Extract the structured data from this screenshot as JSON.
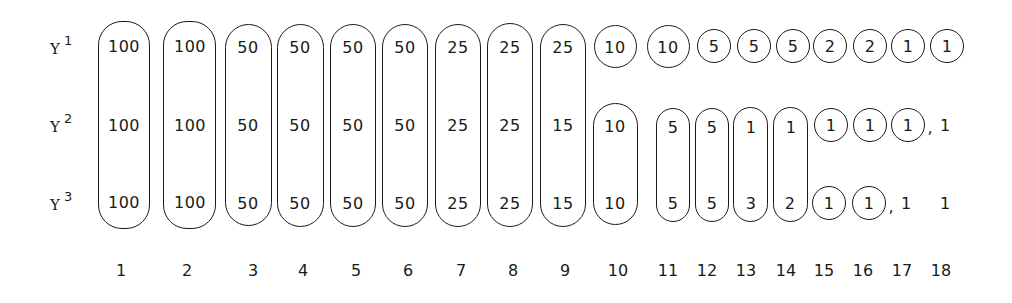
{
  "diagram": {
    "row_labels": [
      {
        "base": "Y",
        "sup": "1"
      },
      {
        "base": "Y",
        "sup": "2"
      },
      {
        "base": "Y",
        "sup": "3"
      }
    ],
    "columns": [
      {
        "index": "1",
        "y1": "100",
        "y2": "100",
        "y3": "100",
        "grouping": "Y1-Y2-Y3 enclosed together"
      },
      {
        "index": "2",
        "y1": "100",
        "y2": "100",
        "y3": "100",
        "grouping": "Y1-Y2-Y3 enclosed together"
      },
      {
        "index": "3",
        "y1": "50",
        "y2": "50",
        "y3": "50",
        "grouping": "Y1-Y2-Y3 enclosed together"
      },
      {
        "index": "4",
        "y1": "50",
        "y2": "50",
        "y3": "50",
        "grouping": "Y1-Y2-Y3 enclosed together"
      },
      {
        "index": "5",
        "y1": "50",
        "y2": "50",
        "y3": "50",
        "grouping": "Y1-Y2-Y3 enclosed together"
      },
      {
        "index": "6",
        "y1": "50",
        "y2": "50",
        "y3": "50",
        "grouping": "Y1-Y2-Y3 enclosed together"
      },
      {
        "index": "7",
        "y1": "25",
        "y2": "25",
        "y3": "25",
        "grouping": "Y1-Y2-Y3 enclosed together"
      },
      {
        "index": "8",
        "y1": "25",
        "y2": "25",
        "y3": "25",
        "grouping": "Y1-Y2-Y3 enclosed together"
      },
      {
        "index": "9",
        "y1": "25",
        "y2": "15",
        "y3": "15",
        "grouping": "Y1-Y2-Y3 enclosed together"
      },
      {
        "index": "10",
        "y1": "10",
        "y2": "10",
        "y3": "10",
        "grouping": "Y1 circled; Y2-Y3 enclosed together"
      },
      {
        "index": "11",
        "y1": "10",
        "y2": "5",
        "y3": "5",
        "grouping": "Y1 circled; Y2-Y3 enclosed together"
      },
      {
        "index": "12",
        "y1": "5",
        "y2": "5",
        "y3": "5",
        "grouping": "Y1 circled; Y2-Y3 enclosed together"
      },
      {
        "index": "13",
        "y1": "5",
        "y2": "1",
        "y3": "3",
        "grouping": "Y1 circled; Y2-Y3 enclosed together"
      },
      {
        "index": "14",
        "y1": "5",
        "y2": "1",
        "y3": "2",
        "grouping": "Y1 circled; Y2-Y3 enclosed together"
      },
      {
        "index": "15",
        "y1": "2",
        "y2": "1",
        "y3": "1",
        "grouping": "each circled separately"
      },
      {
        "index": "16",
        "y1": "2",
        "y2": "1",
        "y3": "1",
        "grouping": "each circled separately"
      },
      {
        "index": "17",
        "y1": "1",
        "y2": "1",
        "y3": "1",
        "grouping": "Y1, Y2 circled; Y3 uncircled"
      },
      {
        "index": "18",
        "y1": "1",
        "y2": "1",
        "y3": "1",
        "grouping": "Y1 circled; Y2, Y3 uncircled"
      }
    ],
    "separators": {
      "comma": ","
    }
  }
}
